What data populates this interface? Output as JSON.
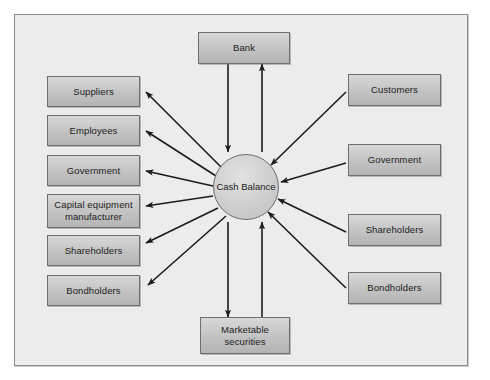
{
  "diagram": {
    "center": {
      "label": "Cash\nBalance",
      "line1": "Cash",
      "line2": "Balance"
    },
    "colors": {
      "panel_background": "#ececec",
      "panel_border": "#8d8d8d",
      "box_fill": "#c7c7c7",
      "box_border": "#6e6e6e",
      "arrow": "#1c1c1c",
      "text": "#1c1c1c"
    },
    "top_nodes": [
      {
        "id": "bank",
        "label": "Bank"
      }
    ],
    "bottom_nodes": [
      {
        "id": "marketable-securities",
        "line1": "Marketable",
        "line2": "securities"
      }
    ],
    "left_nodes": [
      {
        "id": "suppliers",
        "label": "Suppliers"
      },
      {
        "id": "employees",
        "label": "Employees"
      },
      {
        "id": "government-left",
        "label": "Government"
      },
      {
        "id": "capital-equipment-manufacturer",
        "line1": "Capital equipment",
        "line2": "manufacturer"
      },
      {
        "id": "shareholders-left",
        "label": "Shareholders"
      },
      {
        "id": "bondholders-left",
        "label": "Bondholders"
      }
    ],
    "right_nodes": [
      {
        "id": "customers",
        "label": "Customers"
      },
      {
        "id": "government-right",
        "label": "Government"
      },
      {
        "id": "shareholders-right",
        "label": "Shareholders"
      },
      {
        "id": "bondholders-right",
        "label": "Bondholders"
      }
    ],
    "flows": [
      {
        "from": "cash-balance",
        "to": "suppliers",
        "direction": "outflow"
      },
      {
        "from": "cash-balance",
        "to": "employees",
        "direction": "outflow"
      },
      {
        "from": "cash-balance",
        "to": "government-left",
        "direction": "outflow"
      },
      {
        "from": "cash-balance",
        "to": "capital-equipment-manufacturer",
        "direction": "outflow"
      },
      {
        "from": "cash-balance",
        "to": "shareholders-left",
        "direction": "outflow"
      },
      {
        "from": "cash-balance",
        "to": "bondholders-left",
        "direction": "outflow"
      },
      {
        "from": "customers",
        "to": "cash-balance",
        "direction": "inflow"
      },
      {
        "from": "government-right",
        "to": "cash-balance",
        "direction": "inflow"
      },
      {
        "from": "shareholders-right",
        "to": "cash-balance",
        "direction": "inflow"
      },
      {
        "from": "bondholders-right",
        "to": "cash-balance",
        "direction": "inflow"
      },
      {
        "from": "bank",
        "to": "cash-balance",
        "direction": "inflow"
      },
      {
        "from": "cash-balance",
        "to": "bank",
        "direction": "outflow"
      },
      {
        "from": "cash-balance",
        "to": "marketable-securities",
        "direction": "outflow"
      },
      {
        "from": "marketable-securities",
        "to": "cash-balance",
        "direction": "inflow"
      }
    ]
  }
}
